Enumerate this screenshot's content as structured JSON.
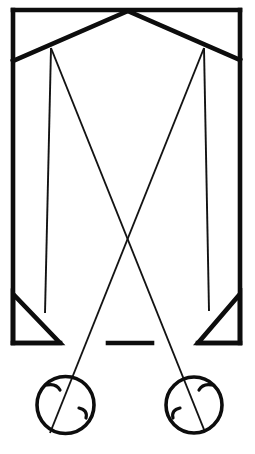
{
  "figure": {
    "type": "technical-line-drawing",
    "canvas": {
      "width": 255,
      "height": 454,
      "background": "#ffffff"
    },
    "ink_color": "#0d0d0d",
    "ray_color": "#131313"
  },
  "geometry": {
    "frame": {
      "name": "outer-frame",
      "left_x": 13,
      "right_x": 240,
      "top_y": 10,
      "bottom_y": 343,
      "stroke_width": 4.6,
      "top_edge": "M 13 10 L 240 10",
      "left_rail": "M 13 10 L 13 343",
      "right_rail": "M 240 10 L 240 343",
      "bottom_left_foot": "M 13 343 L 60 343",
      "bottom_right_foot": "M 198 343 L 240 343"
    },
    "roof_mirrors": {
      "apex_x": 128,
      "apex_y": 11,
      "left_mirror": "M 128 11 L 13 61",
      "right_mirror": "M 128 11 L 240 60",
      "stroke_width": 4.6
    },
    "nodes": {
      "left_node": {
        "x": 51,
        "y": 48
      },
      "right_node": {
        "x": 204,
        "y": 48
      }
    },
    "triangles": {
      "left_prism": "M 13 294 L 13 343 L 60 343 Z",
      "right_prism": "M 240 294 L 240 343 L 198 343 Z",
      "stroke_width": 4.6
    },
    "center_dash": {
      "name": "center-dash",
      "x1": 108,
      "x2": 152,
      "y": 343,
      "stroke_width": 4.6
    },
    "rays": [
      {
        "name": "ray-left-outer",
        "path": "M 51 48 L 45 313"
      },
      {
        "name": "ray-left-inner",
        "path": "M 51 48 L 205 432"
      },
      {
        "name": "ray-right-outer",
        "path": "M 204 48 L 209 311"
      },
      {
        "name": "ray-right-inner",
        "path": "M 204 48 L 50 433"
      }
    ],
    "circles": [
      {
        "name": "left-lens",
        "cx": 65.5,
        "cy": 405,
        "r": 28.5,
        "stroke_width": 3.6,
        "ticks": [
          {
            "name": "left-lens-tick-upper",
            "path": "M 47 385 Q 56 383 60 390"
          },
          {
            "name": "left-lens-tick-right",
            "path": "M 79 408 Q 88 410 86 418"
          }
        ]
      },
      {
        "name": "right-lens",
        "cx": 194,
        "cy": 405,
        "r": 28,
        "stroke_width": 3.6,
        "ticks": [
          {
            "name": "right-lens-tick-upper",
            "path": "M 212 385 Q 203 383 199 390"
          },
          {
            "name": "right-lens-tick-left",
            "path": "M 180 408 Q 171 410 173 418"
          }
        ]
      }
    ]
  }
}
